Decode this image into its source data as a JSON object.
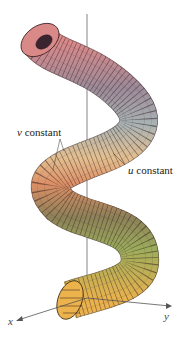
{
  "figure": {
    "type": "parametric surface (helical tube)",
    "labels": {
      "v_constant": {
        "var": "v",
        "text": " constant"
      },
      "u_constant": {
        "var": "u",
        "text": " constant"
      }
    },
    "axes": {
      "x": "x",
      "y": "y"
    },
    "colors": {
      "top": "#d98a86",
      "upper_mid": "#8a8a9a",
      "mid": "#e2a878",
      "lower": "#a8b060",
      "bottom": "#e8b450",
      "grid": "#2a1a1a",
      "axis": "#555555"
    }
  }
}
